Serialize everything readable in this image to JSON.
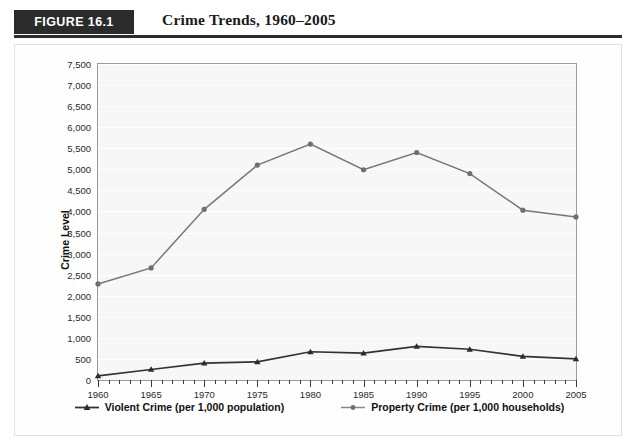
{
  "figure": {
    "badge": "FIGURE 16.1",
    "title": "Crime Trends, 1960–2005"
  },
  "chart_data": {
    "type": "line",
    "title": "Crime Trends, 1960–2005",
    "xlabel": "",
    "ylabel": "Crime Level",
    "x": [
      1960,
      1965,
      1970,
      1975,
      1980,
      1985,
      1990,
      1995,
      2000,
      2005
    ],
    "xtick_labels": [
      "1960",
      "1965",
      "1970",
      "1975",
      "1980",
      "1985",
      "1990",
      "1995",
      "2000",
      "2005"
    ],
    "ytick_labels": [
      "0",
      "500",
      "1,000",
      "1,500",
      "2,000",
      "2,500",
      "3,000",
      "3,500",
      "4,000",
      "4,500",
      "5,000",
      "5,500",
      "6,000",
      "6,500",
      "7,000",
      "7,500"
    ],
    "ytick_values": [
      0,
      500,
      1000,
      1500,
      2000,
      2500,
      3000,
      3500,
      4000,
      4500,
      5000,
      5500,
      6000,
      6500,
      7000,
      7500
    ],
    "ylim": [
      0,
      7500
    ],
    "xlim": [
      1960,
      2005
    ],
    "grid": true,
    "grid_color": "#ffffff",
    "plot_background": "#f7f7f7",
    "legend_position": "bottom",
    "series": [
      {
        "name": "Violent Crime (per 1,000 population)",
        "marker": "triangle",
        "color": "#333333",
        "values": [
          100,
          250,
          400,
          430,
          670,
          640,
          800,
          730,
          560,
          500
        ]
      },
      {
        "name": "Property Crime (per 1,000 households)",
        "marker": "circle",
        "color": "#777777",
        "values": [
          2280,
          2660,
          4050,
          5100,
          5600,
          4990,
          5400,
          4900,
          4030,
          3870
        ]
      }
    ]
  }
}
